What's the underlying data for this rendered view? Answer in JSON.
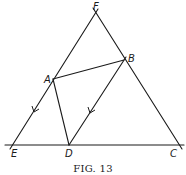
{
  "figure": {
    "caption": "Fig. 13",
    "caption_display": "FIG. 13",
    "points": {
      "F": "F",
      "B": "B",
      "A": "A",
      "E": "E",
      "D": "D",
      "C": "C"
    },
    "segments": [
      {
        "name": "EF",
        "from": "E",
        "to": "F"
      },
      {
        "name": "FC",
        "from": "F",
        "to": "C"
      },
      {
        "name": "EC-line",
        "from": "E",
        "to": "C",
        "extended": true
      },
      {
        "name": "AB",
        "from": "A",
        "to": "B"
      },
      {
        "name": "AD",
        "from": "A",
        "to": "D"
      },
      {
        "name": "BD",
        "from": "B",
        "to": "D"
      }
    ],
    "parallel_marks": [
      "AE",
      "BD"
    ]
  }
}
